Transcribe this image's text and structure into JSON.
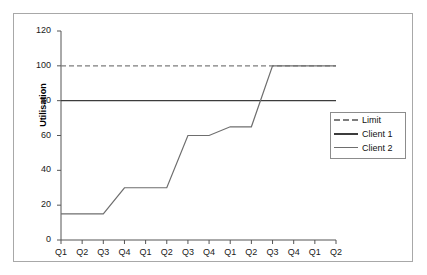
{
  "chart_data": {
    "type": "line",
    "title": "",
    "xlabel": "",
    "ylabel": "Utilisation",
    "ylim": [
      0,
      120
    ],
    "ytick_values": [
      0,
      20,
      40,
      60,
      80,
      100,
      120
    ],
    "ytick_labels": [
      "0",
      "20",
      "40",
      "60",
      "80",
      "100",
      "120"
    ],
    "grid": false,
    "legend_position": "right",
    "categories": [
      "Q1",
      "Q2",
      "Q3",
      "Q4",
      "Q1",
      "Q2",
      "Q3",
      "Q4",
      "Q1",
      "Q2",
      "Q3",
      "Q4",
      "Q1",
      "Q2"
    ],
    "series": [
      {
        "name": "Limit",
        "style": "dashed",
        "color": "#7d7d7d",
        "values": [
          100,
          100,
          100,
          100,
          100,
          100,
          100,
          100,
          100,
          100,
          100,
          100,
          100,
          100
        ]
      },
      {
        "name": "Client 1",
        "style": "solid",
        "color": "#3c3c3c",
        "values": [
          80,
          80,
          80,
          80,
          80,
          80,
          80,
          80,
          80,
          80,
          80,
          80,
          80,
          80
        ]
      },
      {
        "name": "Client 2",
        "style": "solid",
        "color": "#6e6e6e",
        "values": [
          15,
          15,
          15,
          30,
          30,
          30,
          60,
          60,
          65,
          65,
          100,
          100,
          100,
          100
        ]
      }
    ]
  },
  "legend": {
    "entries": [
      {
        "label": "Limit"
      },
      {
        "label": "Client 1"
      },
      {
        "label": "Client 2"
      }
    ]
  },
  "axes": {
    "y_title": "Utilisation"
  },
  "colors": {
    "frame": "#a8a8a8",
    "axis": "#555555",
    "limit": "#7d7d7d",
    "client1": "#3c3c3c",
    "client2": "#6e6e6e",
    "text": "#111111"
  }
}
